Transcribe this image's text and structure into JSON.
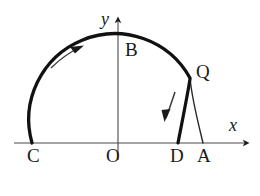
{
  "figure": {
    "background_color": "#ffffff",
    "ink_color": "#1a1a1a",
    "width": 260,
    "height": 196
  },
  "axes": {
    "x_label": "x",
    "y_label": "y",
    "origin_label": "O",
    "x_axis_y": 143,
    "y_axis_x": 118,
    "x_axis_start": 14,
    "x_axis_end": 252,
    "y_axis_top": 14
  },
  "points": [
    {
      "id": "C",
      "label": "C",
      "x": 33,
      "y": 143
    },
    {
      "id": "O",
      "label": "O",
      "x": 118,
      "y": 143
    },
    {
      "id": "D",
      "label": "D",
      "x": 178,
      "y": 143
    },
    {
      "id": "A",
      "label": "A",
      "x": 203,
      "y": 143
    },
    {
      "id": "B",
      "label": "B",
      "x": 118,
      "y": 55
    },
    {
      "id": "Q",
      "label": "Q",
      "x": 190,
      "y": 78
    }
  ],
  "curves": {
    "main_arc": {
      "name": "arc-C-B-Q",
      "style": "thick",
      "stroke_width": 3.2,
      "from": "C",
      "through": "B",
      "to": "Q",
      "center_x": 118,
      "center_y": 143,
      "radius": 86
    },
    "small_arc": {
      "name": "arc-Q-A",
      "style": "thin",
      "stroke_width": 1.5,
      "from": "Q",
      "to": "A"
    },
    "chord": {
      "name": "segment-Q-D",
      "style": "thick",
      "stroke_width": 3.2,
      "from": "Q",
      "to": "D"
    }
  },
  "arrows": {
    "ccw_arrow": {
      "name": "arrow-counterclockwise",
      "direction": "up-right",
      "description": "motion arrow along upper-left arc"
    },
    "down_arrow": {
      "name": "arrow-down-chord",
      "direction": "down-left",
      "description": "motion arrow parallel to segment QD"
    },
    "x_axis_arrow": {
      "name": "arrow-x-axis",
      "direction": "right"
    },
    "y_axis_arrow": {
      "name": "arrow-y-axis",
      "direction": "up"
    }
  }
}
